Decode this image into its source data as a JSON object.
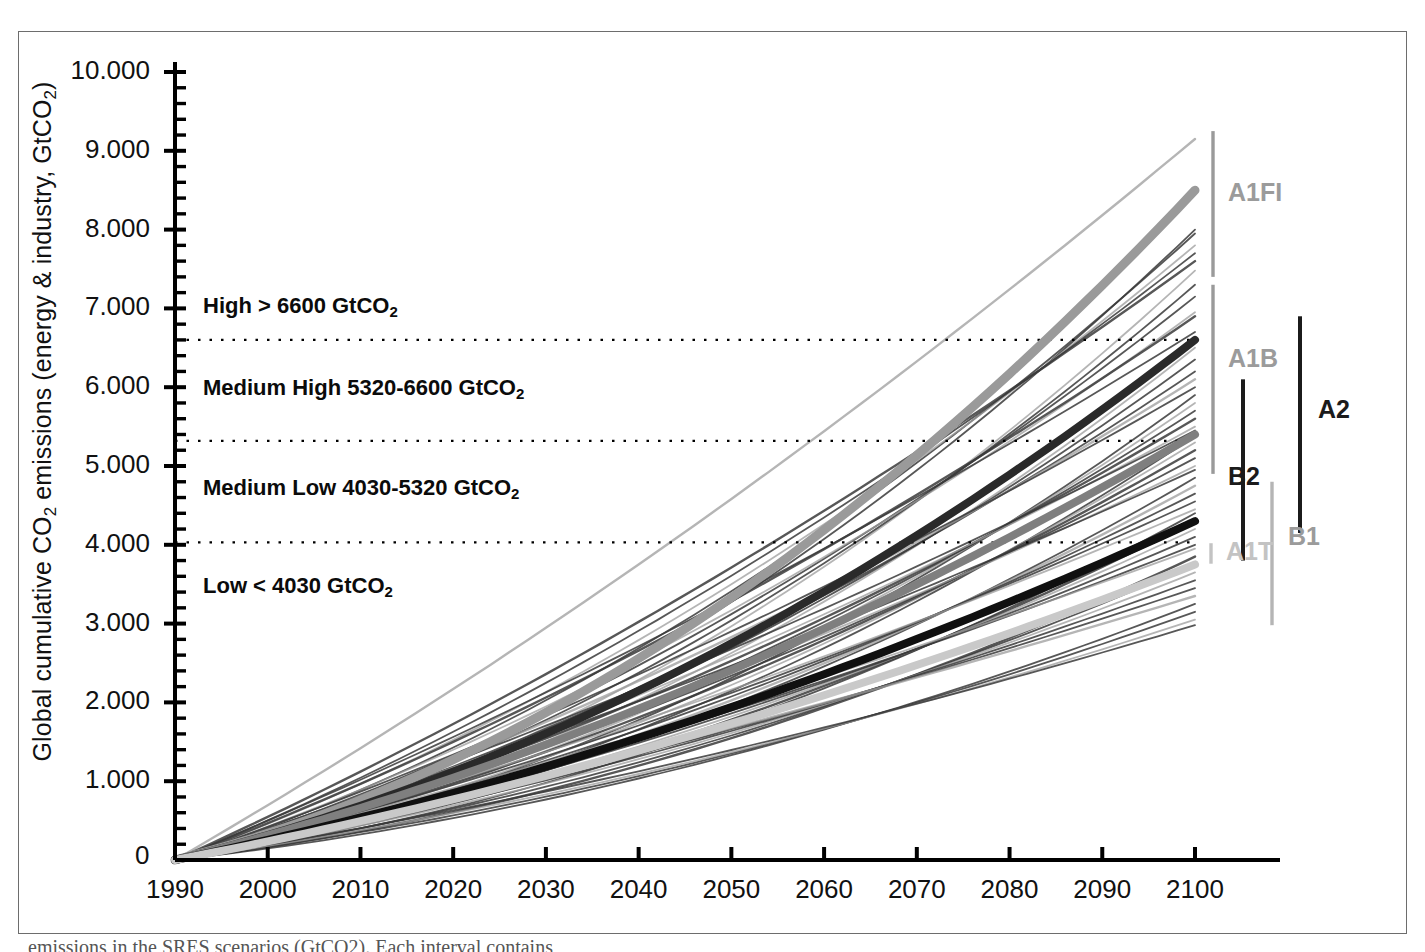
{
  "figure": {
    "caption_partial": "emissions in the SRES scenarios (GtCO2). Each interval contains"
  },
  "chart_data": {
    "type": "line",
    "title": "",
    "xlabel": "",
    "ylabel": "Global cumulative CO2 emissions (energy & industry, GtCO2)",
    "ylabel_parts": {
      "pre": "Global cumulative CO",
      "sub1": "2",
      "mid": " emissions (energy & industry, GtCO",
      "sub2": "2",
      "post": ")"
    },
    "x": [
      1990,
      2000,
      2010,
      2020,
      2030,
      2040,
      2050,
      2060,
      2070,
      2080,
      2090,
      2100
    ],
    "xtick_labels": [
      "1990",
      "2000",
      "2010",
      "2020",
      "2030",
      "2040",
      "2050",
      "2060",
      "2070",
      "2080",
      "2090",
      "2100"
    ],
    "xlim": [
      1990,
      2100
    ],
    "ylim": [
      0,
      10000
    ],
    "ytick_values": [
      0,
      1000,
      2000,
      3000,
      4000,
      5000,
      6000,
      7000,
      8000,
      9000,
      10000
    ],
    "ytick_labels": [
      "0",
      "1.000",
      "2.000",
      "3.000",
      "4.000",
      "5.000",
      "6.000",
      "7.000",
      "8.000",
      "9.000",
      "10.000"
    ],
    "y_minor_step": 200,
    "origin_label": "0",
    "grid": false,
    "legend_position": "right-outside",
    "threshold_lines": [
      {
        "value": 6600,
        "style": "dotted"
      },
      {
        "value": 5320,
        "style": "dotted"
      },
      {
        "value": 4030,
        "style": "dotted"
      }
    ],
    "bands": [
      {
        "name": "High",
        "label": "High > 6600 GtCO",
        "sub": "2",
        "y_text": 7000
      },
      {
        "name": "Medium High",
        "label": "Medium High 5320-6600 GtCO",
        "sub": "2",
        "y_text": 5960
      },
      {
        "name": "Medium Low",
        "label": "Medium Low 4030-5320 GtCO",
        "sub": "2",
        "y_text": 4700
      },
      {
        "name": "Low",
        "label": "Low < 4030 GtCO",
        "sub": "2",
        "y_text": 3450
      }
    ],
    "colors": {
      "A1FI": "#9a9a9a",
      "A1B": "#2a2a2a",
      "A2": "#7f7f7f",
      "B2": "#101010",
      "A1T": "#c9c9c9",
      "B1": "#b5b5b5",
      "thin_dark": "#3a3a3a",
      "thin_gray": "#9c9c9c",
      "axis": "#000000",
      "frame": "#6d6d6d"
    },
    "series": [
      {
        "name": "A1FI",
        "marker": true,
        "width": 9,
        "color": "#9a9a9a",
        "curve": 0.62,
        "values_end": 8500
      },
      {
        "name": "A1B",
        "marker": true,
        "width": 8,
        "color": "#2a2a2a",
        "curve": 0.52,
        "values_end": 6600
      },
      {
        "name": "A2",
        "marker": true,
        "width": 8,
        "color": "#7f7f7f",
        "curve": 0.4,
        "values_end": 5400
      },
      {
        "name": "B2",
        "marker": true,
        "width": 8,
        "color": "#101010",
        "curve": 0.38,
        "values_end": 4300
      },
      {
        "name": "A1T",
        "marker": true,
        "width": 8,
        "color": "#c9c9c9",
        "curve": 0.34,
        "values_end": 3750
      }
    ],
    "legend_entries": [
      {
        "label": "A1FI",
        "color": "#9a9a9a",
        "weight": "normal",
        "range": [
          7400,
          9250
        ]
      },
      {
        "label": "A1B",
        "color": "#9a9a9a",
        "weight": "normal",
        "range": [
          4900,
          7300
        ]
      },
      {
        "label": "A2",
        "color": "#1b1b1b",
        "weight": "bold",
        "range": [
          4150,
          6900
        ]
      },
      {
        "label": "B2",
        "color": "#1b1b1b",
        "weight": "bold",
        "range": [
          3800,
          6100
        ]
      },
      {
        "label": "A1T",
        "color": "#c3c3c3",
        "weight": "normal",
        "range": [
          3760,
          4020
        ]
      },
      {
        "label": "B1",
        "color": "#b5b5b5",
        "weight": "normal",
        "range": [
          2980,
          4800
        ]
      }
    ],
    "thin_line_endpoints": [
      9150,
      8000,
      7950,
      7800,
      7700,
      7600,
      7480,
      7300,
      7150,
      6950,
      6900,
      6700,
      6500,
      6350,
      6200,
      6100,
      6000,
      5900,
      5800,
      5700,
      5600,
      5500,
      5450,
      5380,
      5300,
      5200,
      5100,
      5000,
      4950,
      4850,
      4750,
      4650,
      4550,
      4450,
      4400,
      4300,
      4200,
      4100,
      4000,
      3950,
      3850,
      3750,
      3650,
      3550,
      3450,
      3350,
      3250,
      3150,
      3050,
      2980
    ]
  }
}
